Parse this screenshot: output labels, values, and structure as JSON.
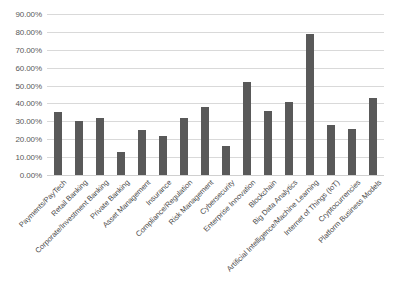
{
  "chart_data": {
    "type": "bar",
    "title": "",
    "subtitle": "",
    "xlabel": "",
    "ylabel": "",
    "ylim": [
      0,
      0.9
    ],
    "grid": true,
    "legend": false,
    "bar_color": "#595959",
    "gridline_color": "#d9d9d9",
    "axis_label_color": "#595959",
    "y_tick_labels": [
      "90.00%",
      "80.00%",
      "70.00%",
      "60.00%",
      "50.00%",
      "40.00%",
      "30.00%",
      "20.00%",
      "10.00%",
      "0.00%"
    ],
    "y_tick_values": [
      0.9,
      0.8,
      0.7,
      0.6,
      0.5,
      0.4,
      0.3,
      0.2,
      0.1,
      0.0
    ],
    "categories": [
      "Payments/PayTech",
      "Retail Banking",
      "Corporate/Investment Banking",
      "Private Banking",
      "Asset Management",
      "Insurance",
      "Compliance/Regulation",
      "Risk Management",
      "Cybersecurity",
      "Enterprise Innovation",
      "Blockchain",
      "Big Data Analytics",
      "Artificial Intelligence/Machine Learning",
      "Internet of Things (IoT)",
      "Cryptocurrencies",
      "Platform Business Models"
    ],
    "values": [
      0.35,
      0.3,
      0.32,
      0.13,
      0.25,
      0.22,
      0.32,
      0.38,
      0.16,
      0.52,
      0.36,
      0.41,
      0.79,
      0.28,
      0.26,
      0.43
    ],
    "value_labels": [
      "35.00%",
      "30.00%",
      "32.00%",
      "13.00%",
      "25.00%",
      "22.00%",
      "32.00%",
      "38.00%",
      "16.00%",
      "52.00%",
      "36.00%",
      "41.00%",
      "79.00%",
      "28.00%",
      "26.00%",
      "43.00%"
    ]
  }
}
